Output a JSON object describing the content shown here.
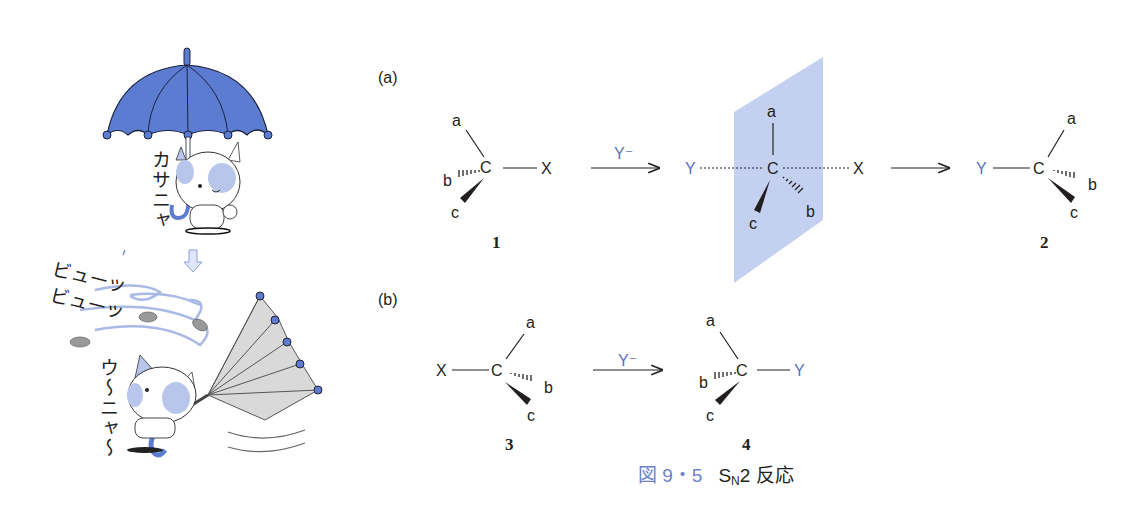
{
  "illustration": {
    "top_sound": "カサニャ",
    "wind_sound_1": "ビューッ",
    "wind_sound_2": "ビューッ",
    "cat_cry": "ウ〜ニャ〜",
    "umbrella_color": "#5b7cd0",
    "arrow_icon": "down-arrow-icon"
  },
  "panel_a": {
    "label": "(a)",
    "reactant": {
      "center": "C",
      "a": "a",
      "b": "b",
      "c": "c",
      "leaving": "X",
      "number": "1"
    },
    "reagent": "Y⁻",
    "transition_state": {
      "nucleophile": "Y",
      "center": "C",
      "a": "a",
      "b": "b",
      "c": "c",
      "leaving": "X"
    },
    "product": {
      "nucleophile": "Y",
      "center": "C",
      "a": "a",
      "b": "b",
      "c": "c",
      "number": "2"
    },
    "plane_color": "#b8c8ec"
  },
  "panel_b": {
    "label": "(b)",
    "reactant": {
      "leaving": "X",
      "center": "C",
      "a": "a",
      "b": "b",
      "c": "c",
      "number": "3"
    },
    "reagent": "Y⁻",
    "product": {
      "nucleophile": "Y",
      "center": "C",
      "a": "a",
      "b": "b",
      "c": "c",
      "number": "4"
    }
  },
  "caption": {
    "figure_number": "図 9・5",
    "title_S": "S",
    "title_sub": "N",
    "title_rest": "2 反応"
  },
  "colors": {
    "accent_blue": "#5b6fc0",
    "caption_blue": "#6e82c8",
    "ink": "#231f20"
  }
}
